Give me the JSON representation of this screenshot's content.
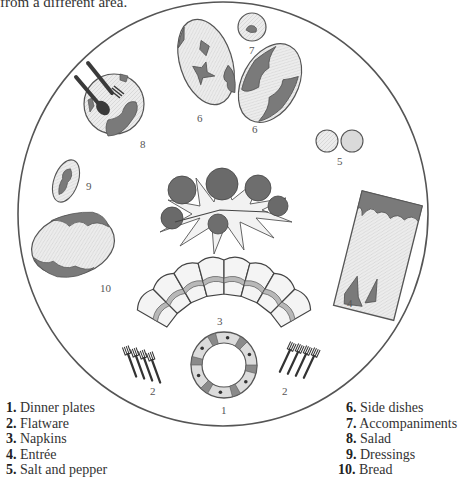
{
  "caption_fragment": "from a different area.",
  "diagram_labels": {
    "dinner_plate": "1",
    "flatware_left": "2",
    "flatware_right": "2",
    "napkins": "3",
    "entree": "4",
    "salt_pepper": "5",
    "side_dish_left": "6",
    "side_dish_right": "6",
    "accompaniments": "7",
    "salad": "8",
    "dressings": "9",
    "bread": "10"
  },
  "legend": {
    "left": [
      {
        "num": "1.",
        "label": "Dinner plates"
      },
      {
        "num": "2.",
        "label": "Flatware"
      },
      {
        "num": "3.",
        "label": "Napkins"
      },
      {
        "num": "4.",
        "label": "Entrée"
      },
      {
        "num": "5.",
        "label": "Salt and pepper"
      }
    ],
    "right": [
      {
        "num": "6.",
        "label": "Side dishes"
      },
      {
        "num": "7.",
        "label": "Accompaniments"
      },
      {
        "num": "8.",
        "label": "Salad"
      },
      {
        "num": "9.",
        "label": "Dressings"
      },
      {
        "num": "10.",
        "label": "Bread"
      }
    ]
  },
  "colors": {
    "outline": "#555555",
    "fill_light": "#e6e6e6",
    "fill_dark": "#7a7a7a"
  }
}
